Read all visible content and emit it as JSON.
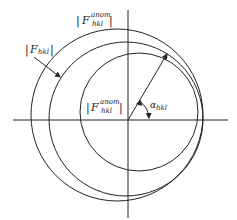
{
  "diagram": {
    "colors": {
      "line": "#222222",
      "background": "#ffffff"
    },
    "labels": {
      "outer_circle": {
        "symbol": "F",
        "superscript": "anom",
        "subscript": "hkl",
        "bar_left": "|",
        "bar_right": "|"
      },
      "middle_circle": {
        "symbol": "F",
        "subscript": "hkl",
        "bar_left": "|",
        "bar_right": "|"
      },
      "inner_circle": {
        "symbol": "F",
        "superscript": "anom",
        "subscript": "hkl",
        "bar_left": "|",
        "bar_right": "|"
      },
      "phase_angle": {
        "symbol": "α",
        "subscript": "hkl"
      }
    },
    "geometry": {
      "origin": [
        128,
        120
      ],
      "common_point": [
        168,
        53
      ],
      "circles": [
        {
          "name": "outer",
          "cx": 117,
          "cy": 115,
          "r": 86
        },
        {
          "name": "middle",
          "cx": 126,
          "cy": 119,
          "r": 77
        },
        {
          "name": "inner",
          "cx": 139,
          "cy": 112,
          "r": 59
        }
      ]
    }
  }
}
